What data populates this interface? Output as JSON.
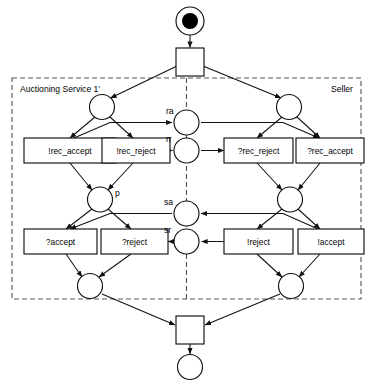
{
  "diagram": {
    "type": "petri-net",
    "zones": [
      {
        "id": "zone-auctioning",
        "label": "Auctioning Service 1'"
      },
      {
        "id": "zone-seller",
        "label": "Seller"
      }
    ],
    "places": [
      {
        "id": "p-init",
        "label": "",
        "marked": true
      },
      {
        "id": "p-left-top",
        "label": "",
        "marked": false
      },
      {
        "id": "p-right-top",
        "label": "",
        "marked": false
      },
      {
        "id": "p-ra",
        "label": "ra",
        "marked": false
      },
      {
        "id": "p-rr",
        "label": "rr",
        "marked": false
      },
      {
        "id": "p-p",
        "label": "p",
        "marked": false
      },
      {
        "id": "p-right-mid",
        "label": "",
        "marked": false
      },
      {
        "id": "p-sa",
        "label": "sa",
        "marked": false
      },
      {
        "id": "p-sr",
        "label": "sr",
        "marked": false
      },
      {
        "id": "p-left-bot",
        "label": "",
        "marked": false
      },
      {
        "id": "p-right-bot",
        "label": "",
        "marked": false
      },
      {
        "id": "p-final",
        "label": "",
        "marked": false
      }
    ],
    "transitions": [
      {
        "id": "t-start",
        "label": "",
        "shape": "square"
      },
      {
        "id": "t-rec-accept",
        "label": "!rec_accept",
        "shape": "rect"
      },
      {
        "id": "t-rec-reject",
        "label": "!rec_reject",
        "shape": "rect"
      },
      {
        "id": "t-q-rec-reject",
        "label": "?rec_reject",
        "shape": "rect"
      },
      {
        "id": "t-q-rec-accept",
        "label": "?rec_accept",
        "shape": "rect"
      },
      {
        "id": "t-q-accept",
        "label": "?accept",
        "shape": "rect"
      },
      {
        "id": "t-q-reject",
        "label": "?reject",
        "shape": "rect"
      },
      {
        "id": "t-e-reject",
        "label": "!reject",
        "shape": "rect"
      },
      {
        "id": "t-e-accept",
        "label": "!accept",
        "shape": "rect"
      },
      {
        "id": "t-end",
        "label": "",
        "shape": "square"
      }
    ],
    "colors": {
      "stroke": "#1a1a1a",
      "token": "#000000",
      "zone_border": "#555555",
      "background": "#ffffff"
    }
  }
}
